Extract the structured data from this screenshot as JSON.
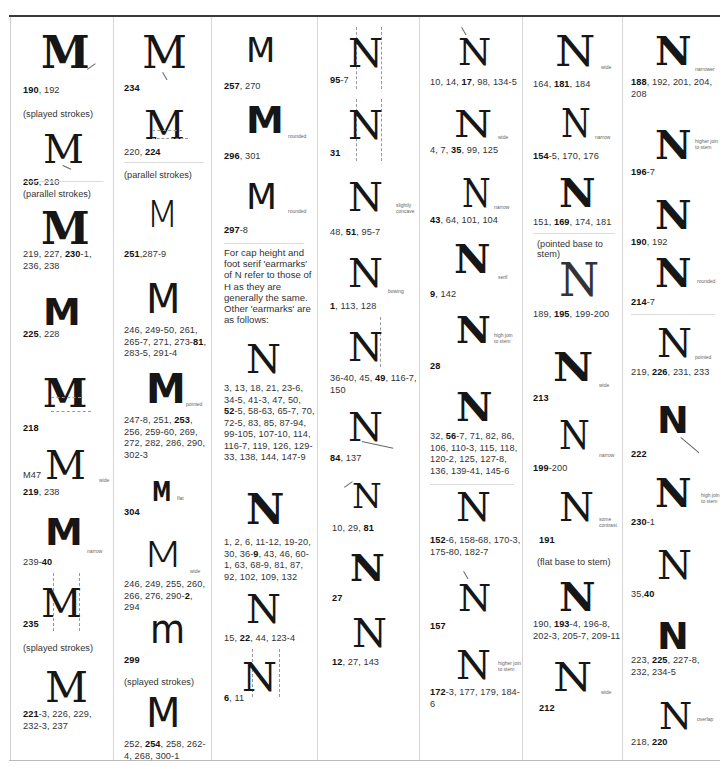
{
  "page": {
    "intro_note": "For cap height and foot serif 'earmarks' of N refer to those of H as they are generally the same. Other 'earmarks' are as follows:"
  },
  "columns": [
    {
      "letter": "M",
      "entries": [
        {
          "glyph": "M",
          "refs_bold": "190",
          "refs": ", 192",
          "note": ""
        },
        {
          "caption": "(splayed strokes)"
        },
        {
          "glyph": "M",
          "refs_bold": "205",
          "refs": ", 210",
          "note": ""
        },
        {
          "caption": "(parallel strokes)"
        },
        {
          "glyph": "M",
          "refs_html": "219, 227, <b>230</b>-1, 236, 238",
          "refs_a": "219, 227, ",
          "refs_bold": "230",
          "refs": "-1, 236, 238",
          "note": ""
        },
        {
          "glyph": "M",
          "refs_bold": "225",
          "refs": ", 228",
          "note": ""
        },
        {
          "glyph": "M",
          "refs_bold": "218",
          "refs": "",
          "note": ""
        },
        {
          "glyph": "M",
          "prefix": "M47",
          "refs_bold": "219",
          "refs": ", 238",
          "note": "wide"
        },
        {
          "glyph": "M",
          "refs_a": "239-",
          "refs_bold": "40",
          "refs": "",
          "note": "narrow"
        },
        {
          "glyph": "M",
          "refs_bold": "235",
          "refs": "",
          "note": ""
        },
        {
          "caption": "(splayed strokes)"
        },
        {
          "glyph": "M",
          "refs_bold": "221",
          "refs": "-3, 226, 229, 232-3, 237",
          "note": ""
        }
      ]
    },
    {
      "letter": "M",
      "entries": [
        {
          "glyph": "M",
          "refs_bold": "234",
          "refs": "",
          "note": ""
        },
        {
          "glyph": "M",
          "refs_a": "220, ",
          "refs_bold": "224",
          "refs": "",
          "note": ""
        },
        {
          "caption": "(parallel strokes)"
        },
        {
          "glyph": "M",
          "refs_bold": "251",
          "refs": ",287-9",
          "note": ""
        },
        {
          "glyph": "M",
          "refs_a": "246, 249-50, 261, 265-7, 271, 273-",
          "refs_bold": "81",
          "refs": ", 283-5, 291-4",
          "note": ""
        },
        {
          "glyph": "M",
          "refs_a": "247-8, 251, ",
          "refs_bold": "253",
          "refs": ", 256, 259-60, 269, 272, 282, 286, 290, 302-3",
          "note": "pointed"
        },
        {
          "glyph": "M",
          "refs_bold": "304",
          "refs": "",
          "note": "flat"
        },
        {
          "glyph": "M",
          "refs_a": "246, 249, 255, 260, 266, 276, 290-",
          "refs_bold": "2",
          "refs": ", 294",
          "note": "wide"
        },
        {
          "glyph": "m",
          "refs_bold": "299",
          "refs": "",
          "note": ""
        },
        {
          "caption": "(splayed strokes)"
        },
        {
          "glyph": "M",
          "refs_a": "252, ",
          "refs_bold": "254",
          "refs": ", 258, 262-4, 268, 300-1",
          "note": ""
        }
      ]
    },
    {
      "letter": "M/N",
      "entries": [
        {
          "glyph": "M",
          "refs_bold": "257",
          "refs": ", 270",
          "note": ""
        },
        {
          "glyph": "M",
          "refs_bold": "296",
          "refs": ", 301",
          "note": "rounded"
        },
        {
          "glyph": "M",
          "refs_bold": "297",
          "refs": "-8",
          "note": "rounded"
        },
        {
          "glyph": "N",
          "refs_a": "3, 13, 18, 21, 23-6, 34-5, 41-3, 47, 50, ",
          "refs_bold": "52",
          "refs": "-5, 58-63, 65-7, 70, 72-5, 83, 85, 87-94, 99-105, 107-10, 114, 116-7, 119, 126, 129-33, 138, 144, 147-9",
          "note": ""
        },
        {
          "glyph": "N",
          "refs_a": "1, 2, 6, 11-12, 19-20, 30, 36-",
          "refs_bold": "9",
          "refs": ", 43, 46, 60-1, 63, 68-9, 81, 87, 92, 102, 109, 132",
          "note": ""
        },
        {
          "glyph": "N",
          "refs_a": "15, ",
          "refs_bold": "22",
          "refs": ", 44, 123-4",
          "note": ""
        },
        {
          "glyph": "N",
          "refs_bold": "6",
          "refs": ", 11",
          "note": ""
        }
      ]
    },
    {
      "letter": "N",
      "entries": [
        {
          "glyph": "N",
          "refs_bold": "95",
          "refs": "-7",
          "note": ""
        },
        {
          "glyph": "N",
          "refs_bold": "31",
          "refs": "",
          "note": ""
        },
        {
          "glyph": "N",
          "refs_a": "48, ",
          "refs_bold": "51",
          "refs": ", 95-7",
          "note": "slightly concave"
        },
        {
          "glyph": "N",
          "refs_bold": "1",
          "refs": ", 113, 128",
          "note": "bowing"
        },
        {
          "glyph": "N",
          "refs_a": "36-40, 45, ",
          "refs_bold": "49",
          "refs": ", 116-7, 150",
          "note": ""
        },
        {
          "glyph": "N",
          "refs_bold": "84",
          "refs": ", 137",
          "note": ""
        },
        {
          "glyph": "N",
          "refs_a": "10, 29, ",
          "refs_bold": "81",
          "refs": "",
          "note": ""
        },
        {
          "glyph": "N",
          "refs_bold": "27",
          "refs": "",
          "note": ""
        },
        {
          "glyph": "N",
          "refs_bold": "12",
          "refs": ", 27, 143",
          "note": ""
        }
      ]
    },
    {
      "letter": "N",
      "entries": [
        {
          "glyph": "N",
          "refs_a": "10, 14, ",
          "refs_bold": "17",
          "refs": ", 98, 134-5",
          "note": ""
        },
        {
          "glyph": "N",
          "refs_a": "4, 7, ",
          "refs_bold": "35",
          "refs": ", 99, 125",
          "note": "wide"
        },
        {
          "glyph": "N",
          "refs_bold": "43",
          "refs": ", 64, 101, 104",
          "note": "narrow"
        },
        {
          "glyph": "N",
          "refs_bold": "9",
          "refs": ", 142",
          "note": "serif"
        },
        {
          "glyph": "N",
          "refs_bold": "28",
          "refs": "",
          "note": "high join to stem"
        },
        {
          "glyph": "N",
          "refs_a": "32, ",
          "refs_bold": "56",
          "refs": "-7, 71, 82, 86, 106, 110-3, 115, 118, 120-2, 125, 127-8, 136, 139-41, 145-6",
          "note": ""
        },
        {
          "glyph": "N",
          "refs_bold": "152",
          "refs": "-6, 158-68, 170-3, 175-80, 182-7",
          "note": ""
        },
        {
          "glyph": "N",
          "refs_bold": "157",
          "refs": "",
          "note": ""
        },
        {
          "glyph": "N",
          "refs_bold": "172",
          "refs": "-3, 177, 179, 184-6",
          "note": "higher join to stem"
        }
      ]
    },
    {
      "letter": "N",
      "entries": [
        {
          "glyph": "N",
          "refs_a": "164, ",
          "refs_bold": "181",
          "refs": ", 184",
          "note": "wide"
        },
        {
          "glyph": "N",
          "refs_bold": "154",
          "refs": "-5, 170, 176",
          "note": "narrow"
        },
        {
          "glyph": "N",
          "refs_a": "151, ",
          "refs_bold": "169",
          "refs": ", 174, 181",
          "note": ""
        },
        {
          "caption": "(pointed base to stem)"
        },
        {
          "glyph": "N",
          "refs_a": "189, ",
          "refs_bold": "195",
          "refs": ", 199-200",
          "note": ""
        },
        {
          "glyph": "N",
          "refs_bold": "213",
          "refs": "",
          "note": "wide"
        },
        {
          "glyph": "N",
          "refs_bold": "199",
          "refs": "-200",
          "note": "narrow"
        },
        {
          "glyph": "N",
          "refs_bold": "191",
          "refs": "",
          "note": "some contrast"
        },
        {
          "caption": "(flat base to stem)"
        },
        {
          "glyph": "N",
          "refs_a": "190, ",
          "refs_bold": "193",
          "refs": "-4, 196-8, 202-3, 205-7, 209-11",
          "note": ""
        },
        {
          "glyph": "N",
          "refs_bold": "212",
          "refs": "",
          "note": "wide"
        }
      ]
    },
    {
      "letter": "N",
      "entries": [
        {
          "glyph": "N",
          "refs_bold": "188",
          "refs": ", 192, 201, 204, 208",
          "note": "narrower"
        },
        {
          "glyph": "N",
          "refs_bold": "196",
          "refs": "-7",
          "note": "higher join to stem"
        },
        {
          "glyph": "N",
          "refs_bold": "190",
          "refs": ", 192",
          "note": ""
        },
        {
          "glyph": "N",
          "refs_bold": "214",
          "refs": "-7",
          "note": "rounded"
        },
        {
          "glyph": "N",
          "refs_a": "219, ",
          "refs_bold": "226",
          "refs": ", 231, 233",
          "note": "pointed"
        },
        {
          "glyph": "N",
          "refs_bold": "222",
          "refs": "",
          "note": ""
        },
        {
          "glyph": "N",
          "refs_bold": "230",
          "refs": "-1",
          "note": "high join to stem"
        },
        {
          "glyph": "N",
          "refs_a": "35,",
          "refs_bold": "40",
          "refs": "",
          "note": ""
        },
        {
          "glyph": "N",
          "refs_a": "223, ",
          "refs_bold": "225",
          "refs": ", 227-8, 232, 234-5",
          "note": ""
        },
        {
          "glyph": "N",
          "refs_a": "218, ",
          "refs_bold": "220",
          "refs": "",
          "note": "overlap"
        }
      ]
    }
  ]
}
